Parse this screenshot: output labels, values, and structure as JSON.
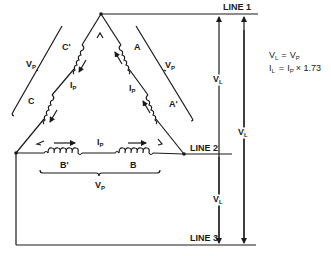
{
  "diagram": {
    "lines": [
      {
        "label": "LINE 1"
      },
      {
        "label": "LINE 2"
      },
      {
        "label": "LINE 3"
      }
    ],
    "coils": {
      "left_upper": "C'",
      "left_lower": "C",
      "right_upper": "A",
      "right_lower": "A'",
      "bottom_left": "B'",
      "bottom_right": "B"
    },
    "phase_voltage": {
      "symbol": "V",
      "subscript": "P"
    },
    "phase_current": {
      "symbol": "I",
      "subscript": "P"
    },
    "line_voltage": {
      "symbol": "V",
      "subscript": "L"
    },
    "equations": [
      {
        "lhs_symbol": "V",
        "lhs_sub": "L",
        "op": "=",
        "rhs_symbol": "V",
        "rhs_sub": "P",
        "rhs_tail": ""
      },
      {
        "lhs_symbol": "I",
        "lhs_sub": "L",
        "op": "=",
        "rhs_symbol": "I",
        "rhs_sub": "P",
        "rhs_tail": "× 1.73"
      }
    ],
    "colors": {
      "ink": "#1a1a1a",
      "background": "#ffffff"
    }
  }
}
